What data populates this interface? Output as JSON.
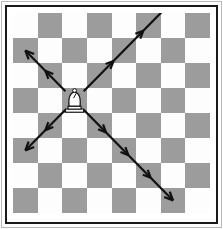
{
  "figure": {
    "title": "Bishop movement diagram",
    "caption": "",
    "border_color": "#1a1a1a",
    "outer_border_color": "#b9b9b9",
    "background": "#ffffff"
  },
  "board": {
    "rows": 8,
    "columns": 8,
    "light_square_color": "#fdfdfd",
    "dark_square_color": "#9c9c9c",
    "top_left_square": "light",
    "squares": [
      [
        "light",
        "dark",
        "light",
        "dark",
        "light",
        "dark",
        "light",
        "dark"
      ],
      [
        "dark",
        "light",
        "dark",
        "light",
        "dark",
        "light",
        "dark",
        "light"
      ],
      [
        "light",
        "dark",
        "light",
        "dark",
        "light",
        "dark",
        "light",
        "dark"
      ],
      [
        "dark",
        "light",
        "dark",
        "light",
        "dark",
        "light",
        "dark",
        "light"
      ],
      [
        "light",
        "dark",
        "light",
        "dark",
        "light",
        "dark",
        "light",
        "dark"
      ],
      [
        "dark",
        "light",
        "dark",
        "light",
        "dark",
        "light",
        "dark",
        "light"
      ],
      [
        "light",
        "dark",
        "light",
        "dark",
        "light",
        "dark",
        "light",
        "dark"
      ],
      [
        "dark",
        "light",
        "dark",
        "light",
        "dark",
        "light",
        "dark",
        "light"
      ]
    ]
  },
  "piece": {
    "type": "bishop",
    "color": "white",
    "square_row": 4,
    "square_column": 3,
    "fill": "#fdfdfd",
    "outline": "#141414"
  },
  "arrows": {
    "color": "#111111",
    "stroke_width": 2.2,
    "count": 4,
    "rays": [
      {
        "name": "up-right",
        "direction": "up-right",
        "arrowheads": 3,
        "squares_traversed": 4
      },
      {
        "name": "up-left",
        "direction": "up-left",
        "arrowheads": 2,
        "squares_traversed": 2
      },
      {
        "name": "down-left",
        "direction": "down-left",
        "arrowheads": 2,
        "squares_traversed": 2
      },
      {
        "name": "down-right",
        "direction": "down-right",
        "arrowheads": 4,
        "squares_traversed": 4
      }
    ]
  }
}
